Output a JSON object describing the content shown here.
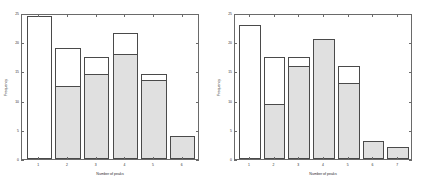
{
  "figure": {
    "background": "#ffffff",
    "axis_color": "#6a6a6a",
    "bar_edge_color": "#4a4a4a",
    "bar_fill_color": "#e0e0e0",
    "bar_empty_color": "#ffffff"
  },
  "chart_data": [
    {
      "type": "bar",
      "id": "left-histogram",
      "title": "",
      "xlabel": "Number of peaks",
      "ylabel": "Frequency",
      "categories": [
        "1",
        "2",
        "3",
        "4",
        "5",
        "6"
      ],
      "xticklabels": [
        "1",
        "2",
        "3",
        "4",
        "5",
        "6"
      ],
      "yticklabels": [
        "0",
        "5",
        "10",
        "15",
        "20",
        "25"
      ],
      "ytickvalues": [
        0,
        5,
        10,
        15,
        20,
        25
      ],
      "xlim": [
        0.4,
        6.6
      ],
      "ylim": [
        0,
        25
      ],
      "grid": false,
      "legend": null,
      "stacked": true,
      "series": [
        {
          "name": "filled",
          "values": [
            0,
            12.5,
            14.5,
            18,
            13.5,
            4
          ]
        },
        {
          "name": "total",
          "values": [
            24.5,
            19,
            17.5,
            21.5,
            14.5,
            4
          ]
        }
      ],
      "values": [
        24.5,
        19,
        17.5,
        21.5,
        14.5,
        4
      ]
    },
    {
      "type": "bar",
      "id": "right-histogram",
      "title": "",
      "xlabel": "Number of peaks",
      "ylabel": "Frequency",
      "categories": [
        "1",
        "2",
        "3",
        "4",
        "5",
        "6",
        "7"
      ],
      "xticklabels": [
        "1",
        "2",
        "3",
        "4",
        "5",
        "6",
        "7"
      ],
      "yticklabels": [
        "0",
        "5",
        "10",
        "15",
        "20",
        "25"
      ],
      "ytickvalues": [
        0,
        5,
        10,
        15,
        20,
        25
      ],
      "xlim": [
        0.4,
        7.6
      ],
      "ylim": [
        0,
        25
      ],
      "grid": false,
      "legend": null,
      "stacked": true,
      "series": [
        {
          "name": "filled",
          "values": [
            0,
            9.5,
            16,
            20.5,
            13,
            3,
            2
          ]
        },
        {
          "name": "total",
          "values": [
            23,
            17.5,
            17.5,
            20.5,
            16,
            3,
            2
          ]
        }
      ],
      "values": [
        23,
        17.5,
        17.5,
        20.5,
        16,
        3,
        2
      ]
    }
  ]
}
